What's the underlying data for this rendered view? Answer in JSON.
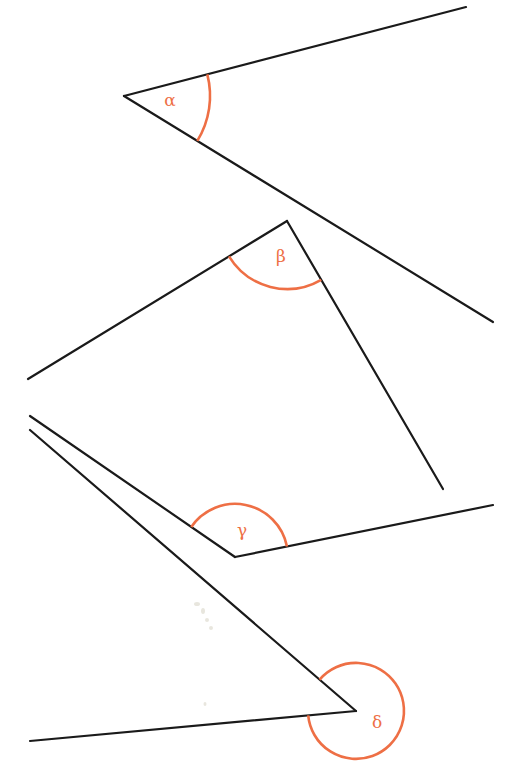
{
  "diagram": {
    "type": "angle-set",
    "colors": {
      "ray": "#1a1a1a",
      "arc": "#ee6f45",
      "label": "#ee6f45",
      "background": "#ffffff"
    },
    "angles": [
      {
        "name": "alpha",
        "label": "α",
        "kind": "acute",
        "vertex": [
          124,
          96
        ],
        "ray1_end": [
          466,
          7
        ],
        "ray2_end": [
          493,
          322
        ],
        "arc_radius": 86,
        "label_pos": [
          170,
          101
        ]
      },
      {
        "name": "beta",
        "label": "β",
        "kind": "acute",
        "vertex": [
          287,
          221
        ],
        "ray1_end": [
          28,
          379
        ],
        "ray2_end": [
          443,
          489
        ],
        "arc_radius": 68,
        "label_pos": [
          281,
          257
        ]
      },
      {
        "name": "gamma",
        "label": "γ",
        "kind": "obtuse",
        "vertex": [
          235,
          557
        ],
        "ray1_end": [
          30,
          416
        ],
        "ray2_end": [
          493,
          505
        ],
        "arc_radius": 53,
        "label_pos": [
          242,
          531
        ]
      },
      {
        "name": "delta",
        "label": "δ",
        "kind": "reflex",
        "vertex": [
          356,
          711
        ],
        "ray1_end": [
          30,
          430
        ],
        "ray2_end": [
          30,
          741
        ],
        "arc_radius": 48,
        "label_pos": [
          377,
          723
        ]
      }
    ]
  }
}
